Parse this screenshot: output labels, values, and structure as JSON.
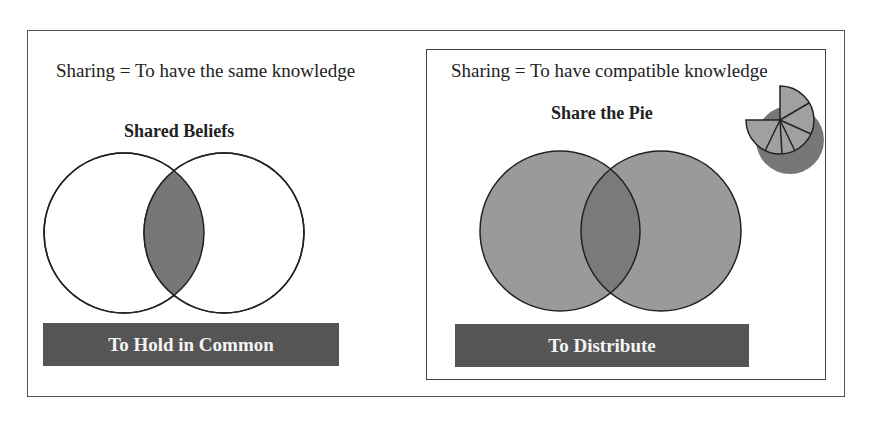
{
  "left_panel": {
    "definition": "Sharing = To have the same knowledge",
    "heading": "Shared Beliefs",
    "label": "To Hold in Common",
    "venn": {
      "circle_fill": "#ffffff",
      "overlap_fill": "#777777"
    }
  },
  "right_panel": {
    "definition": "Sharing = To have compatible knowledge",
    "heading": "Share the Pie",
    "label": "To Distribute",
    "venn": {
      "circle_fill": "#9a9a9a",
      "overlap_fill": "#7a7a7a"
    },
    "pie_icon": "pie-slices-icon"
  },
  "colors": {
    "label_bg": "#555555",
    "stroke": "#222222"
  }
}
